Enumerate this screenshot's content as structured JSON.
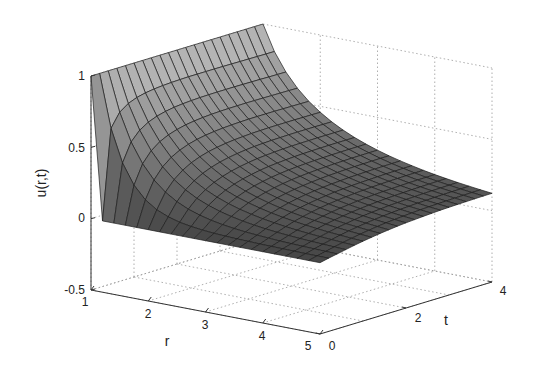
{
  "chart_data": {
    "type": "surface",
    "title": "",
    "xlabel": "r",
    "ylabel": "t",
    "zlabel": "u(r,t)",
    "xlim": [
      1,
      5
    ],
    "ylim": [
      0,
      4
    ],
    "zlim": [
      -0.5,
      1
    ],
    "xticks": [
      "1",
      "2",
      "3",
      "4",
      "5"
    ],
    "yticks": [
      "0",
      "2",
      "4"
    ],
    "zticks": [
      "-0.5",
      "0",
      "0.5",
      "1"
    ],
    "grid": true,
    "colormap": "gray",
    "mesh": {
      "r_count": 21,
      "t_count": 21
    },
    "sample_profile": {
      "r": [
        1,
        2,
        3,
        4,
        5
      ],
      "u_at_t4": [
        1.0,
        0.55,
        0.35,
        0.22,
        0.15
      ],
      "u_at_t0": [
        1.0,
        0.0,
        0.0,
        0.0,
        0.0
      ]
    }
  },
  "labels": {
    "zlabel": "u(r,t)",
    "xlabel": "r",
    "ylabel": "t",
    "zticks": [
      "1",
      "0.5",
      "0",
      "-0.5"
    ],
    "xticks": [
      "1",
      "2",
      "3",
      "4",
      "5"
    ],
    "yticks": [
      "0",
      "2",
      "4"
    ]
  }
}
